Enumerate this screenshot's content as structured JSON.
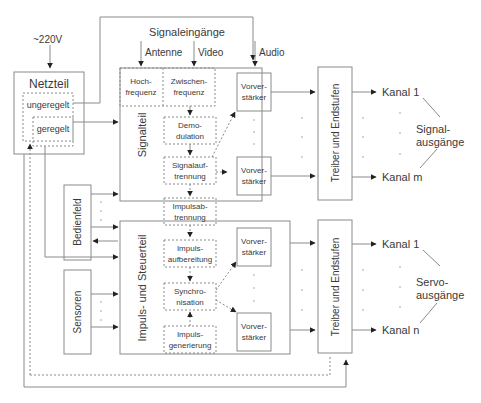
{
  "power": {
    "input_label": "~220V",
    "title": "Netzteil",
    "unregulated": "ungeregelt",
    "regulated": "geregelt"
  },
  "inputs": {
    "header": "Signaleingänge",
    "antenna": "Antenne",
    "video": "Video",
    "audio": "Audio"
  },
  "signal_section": {
    "title": "Signalteil",
    "hf_line1": "Hoch-",
    "hf_line2": "frequenz",
    "if_line1": "Zwischen-",
    "if_line2": "frequenz",
    "demod_line1": "Demo-",
    "demod_line2": "dulation",
    "split_line1": "Signalauf-",
    "split_line2": "trennung",
    "preamp_line1": "Vorver-",
    "preamp_line2": "stärker"
  },
  "pulse_separation": {
    "line1": "Impulsab-",
    "line2": "trennung"
  },
  "control_section": {
    "title": "Impuls- und Steuerteil",
    "prep_line1": "Impuls-",
    "prep_line2": "aufbereitung",
    "sync_line1": "Synchro-",
    "sync_line2": "nisation",
    "gen_line1": "Impuls-",
    "gen_line2": "generierung",
    "preamp_line1": "Vorver-",
    "preamp_line2": "stärker"
  },
  "panel": "Bedienfeld",
  "sensors": "Sensoren",
  "driver": "Treiber und Endstufen",
  "signal_outputs": {
    "first": "Kanal 1",
    "last": "Kanal m",
    "label_line1": "Signal-",
    "label_line2": "ausgänge"
  },
  "servo_outputs": {
    "first": "Kanal 1",
    "last": "Kanal n",
    "label_line1": "Servo-",
    "label_line2": "ausgänge"
  },
  "colors": {
    "line": "#8a8a8a",
    "text": "#3a3a3a",
    "arrow": "#222222"
  }
}
